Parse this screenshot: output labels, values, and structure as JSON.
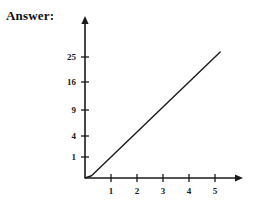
{
  "page": {
    "width": 255,
    "height": 211,
    "background_color": "#ffffff",
    "ink_color": "#1a1a1a"
  },
  "answer": {
    "label": "Answer:"
  },
  "chart_data": {
    "type": "line",
    "title": "",
    "subtitle": "",
    "xlabel": "",
    "ylabel": "",
    "function": "y = x^2",
    "grid": false,
    "legend": null,
    "axis_style": "arrow-axes",
    "xlim": [
      0,
      5.6
    ],
    "ylim": [
      0,
      30
    ],
    "x_ticks": [
      1,
      2,
      3,
      4,
      5
    ],
    "x_tick_labels": [
      "1",
      "2",
      "3",
      "4",
      "5"
    ],
    "y_ticks": [
      1,
      4,
      9,
      16,
      25
    ],
    "y_tick_labels": [
      "1",
      "4",
      "9",
      "16",
      "25"
    ],
    "y_scale_note": "y tick positions follow sqrt spacing (perfect squares evenly spaced)",
    "x": [
      0,
      0.25,
      0.5,
      0.75,
      1,
      1.25,
      1.5,
      1.75,
      2,
      2.25,
      2.5,
      2.75,
      3,
      3.25,
      3.5,
      3.75,
      4,
      4.25,
      4.5,
      4.75,
      5,
      5.1,
      5.2
    ],
    "values": [
      0,
      0.0625,
      0.25,
      0.5625,
      1,
      1.5625,
      2.25,
      3.0625,
      4,
      5.0625,
      6.25,
      7.5625,
      9,
      10.5625,
      12.25,
      14.0625,
      16,
      18.0625,
      20.25,
      22.5625,
      25,
      26.01,
      27.04
    ],
    "series": [
      {
        "name": "y = x^2",
        "values": [
          0,
          0.0625,
          0.25,
          0.5625,
          1,
          1.5625,
          2.25,
          3.0625,
          4,
          5.0625,
          6.25,
          7.5625,
          9,
          10.5625,
          12.25,
          14.0625,
          16,
          18.0625,
          20.25,
          22.5625,
          25,
          26.01,
          27.04
        ]
      }
    ],
    "curve_color": "#1a1a1a",
    "curve_width": 1.4
  },
  "geometry": {
    "origin_x": 85,
    "origin_y": 178,
    "y_axis_top": 16,
    "x_axis_right": 243,
    "x_unit_px": 26,
    "y_tick_px": {
      "1": 157,
      "4": 136,
      "9": 110,
      "16": 82,
      "25": 57
    },
    "curve_end_y": 15
  }
}
